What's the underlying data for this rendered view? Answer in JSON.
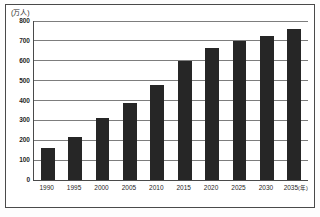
{
  "chart_data": {
    "type": "bar",
    "title": "",
    "subtitle": "",
    "unit_label": "(万人)",
    "xlabel": "(年)",
    "ylabel": "",
    "categories": [
      "1990",
      "1995",
      "2000",
      "2005",
      "2010",
      "2015",
      "2020",
      "2025",
      "2030",
      "2035"
    ],
    "values": [
      160,
      215,
      310,
      385,
      480,
      600,
      665,
      700,
      725,
      760
    ],
    "ylim": [
      0,
      800
    ],
    "ytick_labels": [
      "0",
      "100",
      "200",
      "300",
      "400",
      "500",
      "600",
      "700",
      "800"
    ],
    "ytick_values": [
      0,
      100,
      200,
      300,
      400,
      500,
      600,
      700,
      800
    ],
    "grid": true,
    "legend": "none",
    "bar_color": "#262626",
    "axis_color": "#4a4a4a",
    "grid_color": "#7d7d7d",
    "x_axis_suffix": "(年)"
  }
}
